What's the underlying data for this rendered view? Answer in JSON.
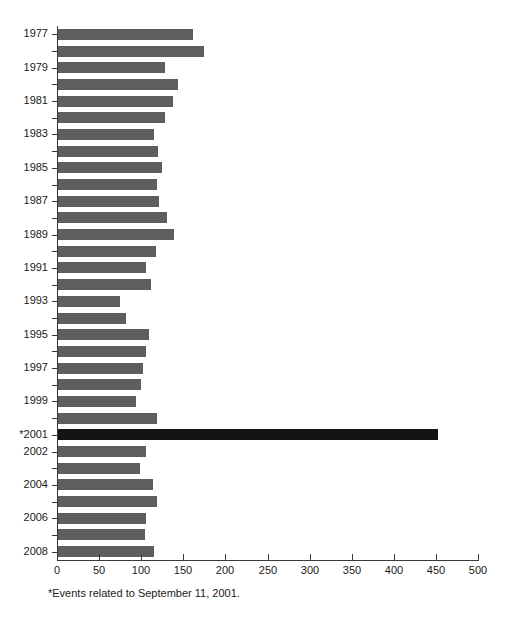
{
  "chart_data": {
    "type": "bar",
    "orientation": "horizontal",
    "title": "",
    "subtitle": "",
    "xlabel": "",
    "ylabel": "",
    "xlim": [
      0,
      500
    ],
    "xticks": [
      0,
      50,
      100,
      150,
      200,
      250,
      300,
      350,
      400,
      450,
      500
    ],
    "xtick_labels": [
      "0",
      "50",
      "100",
      "150",
      "200",
      "250",
      "300",
      "350",
      "400",
      "450",
      "500"
    ],
    "grid": false,
    "legend": null,
    "categories": [
      "1977",
      "1978",
      "1979",
      "1980",
      "1981",
      "1982",
      "1983",
      "1984",
      "1985",
      "1986",
      "1987",
      "1988",
      "1989",
      "1990",
      "1991",
      "1992",
      "1993",
      "1994",
      "1995",
      "1996",
      "1997",
      "1998",
      "1999",
      "2000",
      "*2001",
      "2002",
      "2003",
      "2004",
      "2005",
      "2006",
      "2007",
      "2008"
    ],
    "visible_tick_labels": [
      "1977",
      "",
      "1979",
      "",
      "1981",
      "",
      "1983",
      "",
      "1985",
      "",
      "1987",
      "",
      "1989",
      "",
      "1991",
      "",
      "1993",
      "",
      "1995",
      "",
      "1997",
      "",
      "1999",
      "",
      "*2001",
      "2002",
      "",
      "2004",
      "",
      "2006",
      "",
      "2008"
    ],
    "values": [
      160,
      173,
      127,
      143,
      136,
      127,
      114,
      119,
      123,
      118,
      120,
      130,
      138,
      116,
      105,
      110,
      74,
      81,
      108,
      104,
      101,
      99,
      93,
      117,
      451,
      105,
      97,
      113,
      117,
      105,
      103,
      114
    ],
    "bar_colors": [
      "#5e5e5e",
      "#5e5e5e",
      "#5e5e5e",
      "#5e5e5e",
      "#5e5e5e",
      "#5e5e5e",
      "#5e5e5e",
      "#5e5e5e",
      "#5e5e5e",
      "#5e5e5e",
      "#5e5e5e",
      "#5e5e5e",
      "#5e5e5e",
      "#5e5e5e",
      "#5e5e5e",
      "#5e5e5e",
      "#5e5e5e",
      "#5e5e5e",
      "#5e5e5e",
      "#5e5e5e",
      "#5e5e5e",
      "#5e5e5e",
      "#5e5e5e",
      "#5e5e5e",
      "#141414",
      "#5e5e5e",
      "#5e5e5e",
      "#5e5e5e",
      "#5e5e5e",
      "#5e5e5e",
      "#5e5e5e",
      "#5e5e5e"
    ],
    "highlight_index": 24,
    "annotations": [
      {
        "name": "footnote",
        "text": "*Events related to September 11, 2001."
      }
    ]
  },
  "colors": {
    "bar": "#5e5e5e",
    "bar_highlight": "#141414",
    "axis": "#3a3a3a",
    "text": "#1a1a1a",
    "background": "#ffffff"
  },
  "footnote": {
    "text": "*Events related to September 11, 2001."
  }
}
